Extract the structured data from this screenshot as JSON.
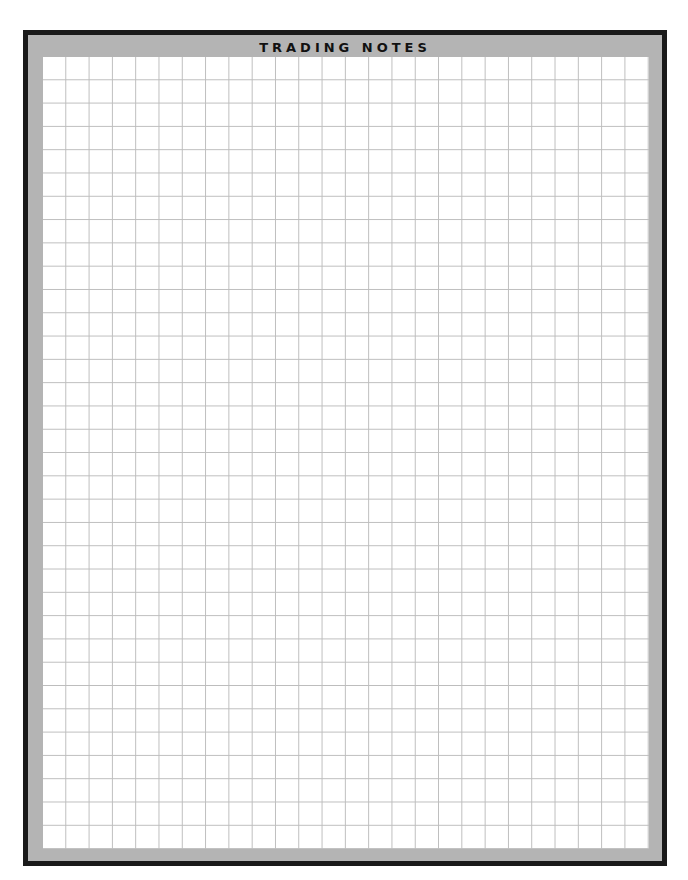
{
  "page": {
    "title": "TRADING NOTES",
    "grid": {
      "columns": 26,
      "rows": 34
    },
    "colors": {
      "border": "#1a1a1a",
      "band": "#b4b4b4",
      "grid_line": "#bdbdbd",
      "paper": "#ffffff"
    }
  }
}
